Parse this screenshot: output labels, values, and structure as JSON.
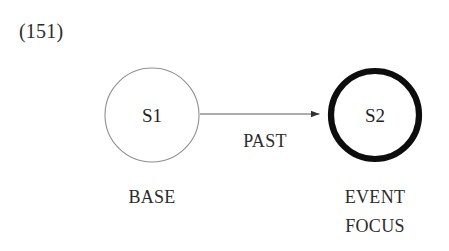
{
  "figure": {
    "example_number": "(151)",
    "background_color": "#ffffff",
    "ink_color": "#2b2b2b"
  },
  "nodes": [
    {
      "id": "s1",
      "label": "S1",
      "caption_lines": [
        "BASE"
      ],
      "role": "base",
      "stroke_style": "thin",
      "stroke_color": "#8a8a8a",
      "stroke_width": 1,
      "fill": "#ffffff",
      "cx": 152,
      "cy": 115,
      "r": 47
    },
    {
      "id": "s2",
      "label": "S2",
      "caption_lines": [
        "EVENT",
        "FOCUS"
      ],
      "role": "event-focus",
      "stroke_style": "thick",
      "stroke_color": "#0d0d0d",
      "stroke_width": 6,
      "fill": "#ffffff",
      "cx": 375,
      "cy": 115,
      "r": 44
    }
  ],
  "edges": [
    {
      "id": "s1-to-s2",
      "label": "PAST",
      "from": "s1",
      "to": "s2",
      "color": "#4a4a4a",
      "line_width": 1,
      "x1": 200,
      "x2": 328,
      "y": 114,
      "arrowhead": "solid-triangle"
    }
  ]
}
